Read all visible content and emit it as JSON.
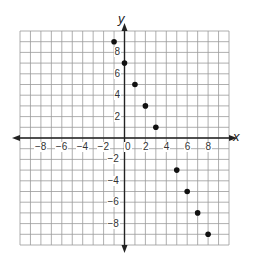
{
  "chart_data": {
    "type": "scatter",
    "title": "",
    "xlabel": "x",
    "ylabel": "y",
    "xlim": [
      -10,
      10
    ],
    "ylim": [
      -10,
      10
    ],
    "grid": true,
    "grid_step": 1,
    "x_ticks": [
      -8,
      -6,
      -4,
      -2,
      0,
      2,
      4,
      6,
      8
    ],
    "y_ticks": [
      -8,
      -6,
      -4,
      -2,
      2,
      4,
      6,
      8
    ],
    "x_tick_labels": [
      "−8",
      "−6",
      "−4",
      "−2",
      "0",
      "2",
      "4",
      "6",
      "8"
    ],
    "y_tick_labels": [
      "−8",
      "−6",
      "−4",
      "−2",
      "2",
      "4",
      "6",
      "8"
    ],
    "series": [
      {
        "name": "points",
        "x": [
          -1,
          0,
          1,
          2,
          3,
          4,
          5,
          6,
          7,
          8
        ],
        "y": [
          9,
          7,
          5,
          3,
          1,
          -1,
          -3,
          -5,
          -7,
          -9
        ]
      }
    ],
    "legend": null
  },
  "colors": {
    "grid": "#9a9a9a",
    "axis": "#222222",
    "point": "#111111"
  }
}
